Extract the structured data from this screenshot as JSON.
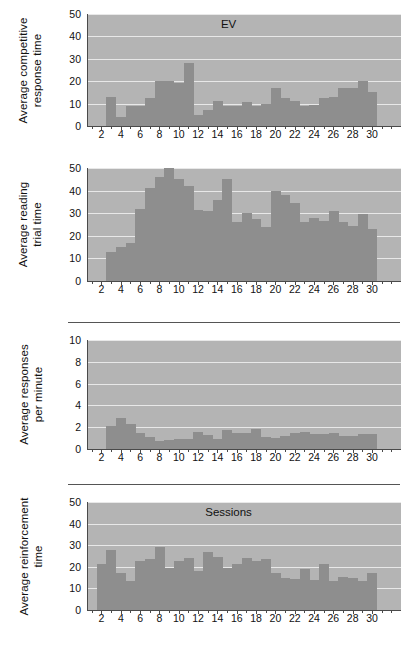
{
  "figure": {
    "panel_count": 4,
    "bar_color": "#8e8e8e",
    "plot_background": "#b4b4b4",
    "gridline_color": "#e8e8e8",
    "axis_color": "#4a4a4a"
  },
  "separators": [
    {
      "name": "separator-above-panel-3"
    },
    {
      "name": "separator-above-panel-4"
    }
  ],
  "chart_data": [
    {
      "type": "bar",
      "title": "EV",
      "xlabel": "",
      "ylabel": "Average competitive response time",
      "ylabel_lines": [
        "Average competitive",
        "response time"
      ],
      "ylim": [
        0,
        50
      ],
      "yticks": [
        0,
        10,
        20,
        30,
        40,
        50
      ],
      "xlim": [
        0.5,
        33
      ],
      "xticks": [
        2,
        4,
        6,
        8,
        10,
        12,
        14,
        16,
        18,
        20,
        22,
        24,
        26,
        28,
        30
      ],
      "grid": true,
      "legend": "none",
      "x": [
        3,
        4,
        5,
        6,
        7,
        8,
        9,
        10,
        11,
        12,
        13,
        14,
        15,
        16,
        17,
        18,
        19,
        20,
        21,
        22,
        23,
        24,
        25,
        26,
        27,
        28,
        29,
        30
      ],
      "values": [
        13,
        4,
        9,
        9,
        12.5,
        20,
        20,
        19,
        28,
        5,
        7,
        11,
        9,
        9,
        10.5,
        9,
        10,
        17,
        12.5,
        11,
        9,
        9.5,
        12.5,
        13,
        17,
        17,
        20,
        15
      ]
    },
    {
      "type": "bar",
      "title": "",
      "xlabel": "",
      "ylabel": "Average reading trial time",
      "ylabel_lines": [
        "Average reading",
        "trial time"
      ],
      "ylim": [
        0,
        50
      ],
      "yticks": [
        0,
        10,
        20,
        30,
        40,
        50
      ],
      "xlim": [
        0.5,
        33
      ],
      "xticks": [
        2,
        4,
        6,
        8,
        10,
        12,
        14,
        16,
        18,
        20,
        22,
        24,
        26,
        28,
        30
      ],
      "grid": true,
      "legend": "none",
      "x": [
        3,
        4,
        5,
        6,
        7,
        8,
        9,
        10,
        11,
        12,
        13,
        14,
        15,
        16,
        17,
        18,
        19,
        20,
        21,
        22,
        23,
        24,
        25,
        26,
        27,
        28,
        29,
        30
      ],
      "values": [
        13,
        15,
        17,
        32,
        41,
        46,
        50,
        45,
        42,
        31.5,
        31,
        36,
        45,
        26,
        30,
        27.5,
        24,
        40,
        38,
        34.5,
        26,
        28,
        26.5,
        31,
        26,
        24.5,
        29.5,
        23
      ]
    },
    {
      "type": "bar",
      "title": "",
      "xlabel": "",
      "ylabel": "Average responses per minute",
      "ylabel_lines": [
        "Average responses",
        "per minute"
      ],
      "ylim": [
        0,
        10
      ],
      "yticks": [
        0,
        2,
        4,
        6,
        8,
        10
      ],
      "xlim": [
        0.5,
        33
      ],
      "xticks": [
        2,
        4,
        6,
        8,
        10,
        12,
        14,
        16,
        18,
        20,
        22,
        24,
        26,
        28,
        30
      ],
      "grid": true,
      "legend": "none",
      "x": [
        3,
        4,
        5,
        6,
        7,
        8,
        9,
        10,
        11,
        12,
        13,
        14,
        15,
        16,
        17,
        18,
        19,
        20,
        21,
        22,
        23,
        24,
        25,
        26,
        27,
        28,
        29,
        30
      ],
      "values": [
        2.1,
        2.85,
        2.3,
        1.45,
        1.1,
        0.75,
        0.8,
        0.9,
        0.9,
        1.55,
        1.3,
        0.9,
        1.7,
        1.5,
        1.5,
        1.85,
        1.1,
        1.05,
        1.2,
        1.5,
        1.6,
        1.35,
        1.35,
        1.45,
        1.2,
        1.2,
        1.4,
        1.4
      ]
    },
    {
      "type": "bar",
      "title": "Sessions",
      "xlabel": "",
      "ylabel": "Average reinforcement time",
      "ylabel_lines": [
        "Average reinforcement",
        "time"
      ],
      "ylim": [
        0,
        50
      ],
      "yticks": [
        0,
        10,
        20,
        30,
        40,
        50
      ],
      "xlim": [
        0.5,
        33
      ],
      "xticks": [
        2,
        4,
        6,
        8,
        10,
        12,
        14,
        16,
        18,
        20,
        22,
        24,
        26,
        28,
        30
      ],
      "grid": true,
      "legend": "none",
      "x": [
        2,
        3,
        4,
        5,
        6,
        7,
        8,
        9,
        10,
        11,
        12,
        13,
        14,
        15,
        16,
        17,
        18,
        19,
        20,
        21,
        22,
        23,
        24,
        25,
        26,
        27,
        28,
        29,
        30
      ],
      "values": [
        21.5,
        28,
        17,
        13.5,
        22.5,
        23.5,
        29,
        19.5,
        22.5,
        24,
        18,
        27,
        24.5,
        19.5,
        21.5,
        24,
        22.5,
        23.5,
        17,
        15,
        14.5,
        19,
        14,
        21.5,
        13.5,
        15.5,
        15,
        13.5,
        17
      ]
    }
  ]
}
